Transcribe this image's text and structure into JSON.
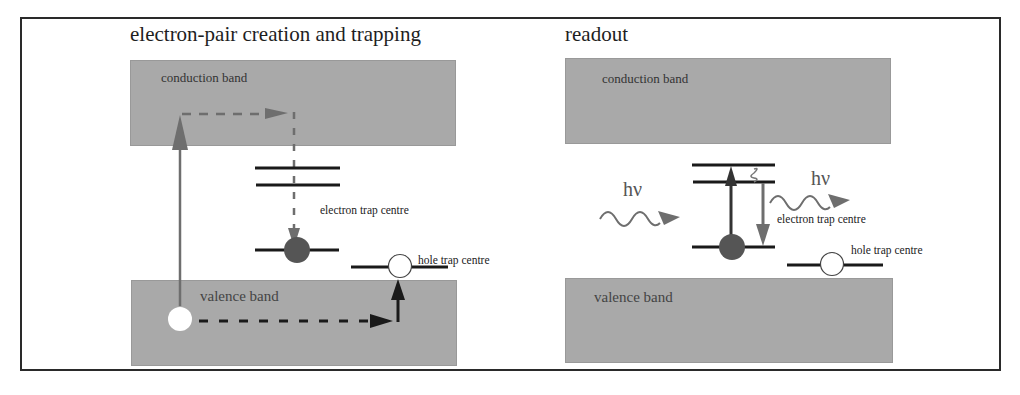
{
  "panels": {
    "left": {
      "title": "electron-pair creation and trapping",
      "conduction_band_label": "conduction band",
      "valence_band_label": "valence band",
      "electron_trap_label": "electron trap centre",
      "hole_trap_label": "hole trap centre"
    },
    "right": {
      "title": "readout",
      "conduction_band_label": "conduction band",
      "valence_band_label": "valence band",
      "electron_trap_label": "electron trap centre",
      "hole_trap_label": "hole trap centre",
      "photon_in_label": "hν",
      "photon_out_label": "hν"
    }
  },
  "colors": {
    "band_fill": "#a9a9a9",
    "arrow_gray": "#6e6e6e",
    "level_line": "#1a1a1a",
    "electron_fill": "#555555",
    "hole_fill": "#ffffff"
  }
}
